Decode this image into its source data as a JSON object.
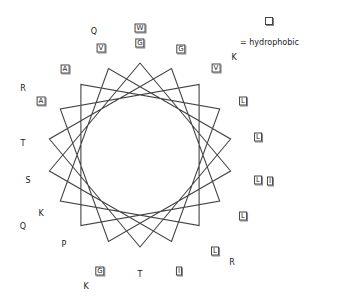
{
  "diagram": {
    "type": "helical-wheel",
    "center": [
      140,
      155
    ],
    "outer_radius": 92,
    "inner_radius": 68,
    "star_points": 18,
    "line_color": "#444444"
  },
  "legend": {
    "symbol": "boxed-residue",
    "label": "= hydrophobic"
  },
  "residues": [
    {
      "aa": "W",
      "x": 140,
      "y": 28,
      "hydrophobic": true
    },
    {
      "aa": "G",
      "x": 140,
      "y": 43,
      "hydrophobic": true
    },
    {
      "aa": "Q",
      "x": 94,
      "y": 32,
      "hydrophobic": false
    },
    {
      "aa": "V",
      "x": 101,
      "y": 48,
      "hydrophobic": true
    },
    {
      "aa": "G",
      "x": 181,
      "y": 49,
      "hydrophobic": true
    },
    {
      "aa": "K",
      "x": 234,
      "y": 58,
      "hydrophobic": false
    },
    {
      "aa": "V",
      "x": 216,
      "y": 68,
      "hydrophobic": true
    },
    {
      "aa": "A",
      "x": 65,
      "y": 69,
      "hydrophobic": true
    },
    {
      "aa": "R",
      "x": 23,
      "y": 89,
      "hydrophobic": false
    },
    {
      "aa": "A",
      "x": 41,
      "y": 101,
      "hydrophobic": true
    },
    {
      "aa": "L",
      "x": 243,
      "y": 101,
      "hydrophobic": true
    },
    {
      "aa": "L",
      "x": 258,
      "y": 137,
      "hydrophobic": true
    },
    {
      "aa": "T",
      "x": 23,
      "y": 144,
      "hydrophobic": false
    },
    {
      "aa": "L",
      "x": 258,
      "y": 180,
      "hydrophobic": true
    },
    {
      "aa": "I",
      "x": 270,
      "y": 181,
      "hydrophobic": true
    },
    {
      "aa": "S",
      "x": 28,
      "y": 181,
      "hydrophobic": false
    },
    {
      "aa": "L",
      "x": 243,
      "y": 216,
      "hydrophobic": true
    },
    {
      "aa": "K",
      "x": 41,
      "y": 214,
      "hydrophobic": false
    },
    {
      "aa": "Q",
      "x": 23,
      "y": 227,
      "hydrophobic": false
    },
    {
      "aa": "P",
      "x": 64,
      "y": 245,
      "hydrophobic": false
    },
    {
      "aa": "L",
      "x": 215,
      "y": 251,
      "hydrophobic": true
    },
    {
      "aa": "R",
      "x": 232,
      "y": 263,
      "hydrophobic": false
    },
    {
      "aa": "G",
      "x": 100,
      "y": 271,
      "hydrophobic": true
    },
    {
      "aa": "T",
      "x": 140,
      "y": 275,
      "hydrophobic": false
    },
    {
      "aa": "I",
      "x": 179,
      "y": 271,
      "hydrophobic": true
    },
    {
      "aa": "K",
      "x": 86,
      "y": 287,
      "hydrophobic": false
    }
  ]
}
